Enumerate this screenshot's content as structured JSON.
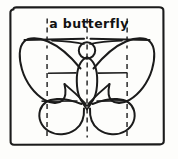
{
  "drawing": {
    "title": "a butterfly",
    "subject": "butterfly",
    "medium": "hand-drawn pencil sketch",
    "caption": {
      "text": "a butterfly",
      "style": "hand-lettered",
      "position": "top-center"
    },
    "frame": {
      "name": "sketch-frame",
      "shape": "rounded-rectangle",
      "stroke_color": "#1b1b1b",
      "x": 10,
      "y": 7,
      "width": 155,
      "height": 138
    },
    "canvas": {
      "width": 178,
      "height": 159,
      "background_color": "#fdfdfb",
      "ink_color": "#1b1b1b"
    },
    "guides": {
      "label": "construction guide lines",
      "vertical_dashed": [
        {
          "name": "guide-vertical-left",
          "x": 47,
          "y1": 18,
          "y2": 138
        },
        {
          "name": "guide-vertical-center",
          "x": 87,
          "y1": 18,
          "y2": 138
        },
        {
          "name": "guide-vertical-right",
          "x": 127,
          "y1": 18,
          "y2": 138
        }
      ],
      "horizontal_solid": [
        {
          "name": "guide-horizontal-upper",
          "y": 73,
          "x1": 48,
          "x2": 127
        },
        {
          "name": "guide-horizontal-lower",
          "y": 101,
          "x1": 48,
          "x2": 127
        }
      ]
    },
    "parts": [
      {
        "name": "head",
        "shape": "circle",
        "cx": 87,
        "cy": 50,
        "r": 8
      },
      {
        "name": "body",
        "shape": "ellipse",
        "cx": 87,
        "cy": 81,
        "rx": 10,
        "ry": 24
      },
      {
        "name": "antenna-left",
        "shape": "curve"
      },
      {
        "name": "antenna-right",
        "shape": "curve"
      },
      {
        "name": "upper-wing-left",
        "shape": "curve"
      },
      {
        "name": "upper-wing-right",
        "shape": "curve"
      },
      {
        "name": "lower-wing-left",
        "shape": "curve"
      },
      {
        "name": "lower-wing-right",
        "shape": "curve"
      }
    ]
  }
}
